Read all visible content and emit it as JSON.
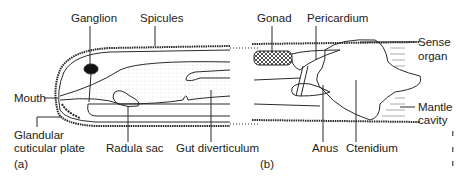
{
  "panel_a": {
    "tag": "(a)",
    "labels": {
      "ganglion": "Ganglion",
      "spicules": "Spicules",
      "mouth": "Mouth",
      "glandular_1": "Glandular",
      "glandular_2": "cuticular plate",
      "radula_sac": "Radula sac",
      "gut_diverticulum": "Gut diverticulum"
    }
  },
  "panel_b": {
    "tag": "(b)",
    "labels": {
      "gonad": "Gonad",
      "pericardium": "Pericardium",
      "sense_1": "Sense",
      "sense_2": "organ",
      "mantle_1": "Mantle",
      "mantle_2": "cavity",
      "anus": "Anus",
      "ctenidium": "Ctenidium"
    }
  },
  "colors": {
    "line": "#2a2a2a",
    "text": "#1a1a1a",
    "stipple": "#d8d8d8"
  }
}
